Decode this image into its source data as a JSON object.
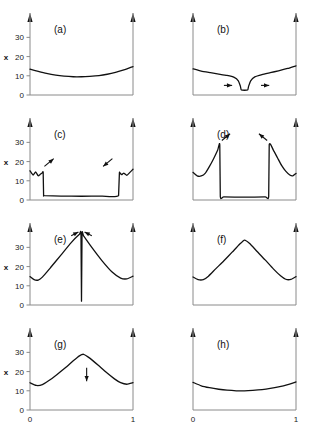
{
  "figure": {
    "title": "",
    "axis_label_y": "x",
    "x_tick_labels": [
      "0",
      "1"
    ],
    "y_tick_labels": [
      "0",
      "10",
      "20",
      "30"
    ],
    "y_tick_values": [
      0,
      10,
      20,
      30
    ],
    "x_tick_values": [
      0,
      1
    ],
    "panel_labels": [
      "(a)",
      "(b)",
      "(c)",
      "(d)",
      "(e)",
      "(f)",
      "(g)",
      "(h)"
    ],
    "colors": {
      "curve": "#111111",
      "axis": "#8a8a8a",
      "background": "#ffffff",
      "annotation": "#111111"
    }
  },
  "chart_data": {
    "type": "line",
    "title": "",
    "xlabel": "",
    "ylabel": "x",
    "xlim": [
      0,
      1
    ],
    "ylim": [
      0,
      38
    ],
    "grid": false,
    "legend": "none",
    "x_ticks": [
      0,
      1
    ],
    "x_ticklabels": [
      "0",
      "1"
    ],
    "y_ticks": [
      0,
      10,
      20,
      30
    ],
    "y_ticklabels": [
      "0",
      "10",
      "20",
      "30"
    ],
    "panels": [
      {
        "label": "(a)",
        "row": 0,
        "col": 0,
        "description": "shallow symmetric basin, weakly concave-up profile",
        "x": [
          0.0,
          0.08,
          0.16,
          0.25,
          0.33,
          0.42,
          0.5,
          0.58,
          0.67,
          0.75,
          0.83,
          0.92,
          1.0
        ],
        "y": [
          13.5,
          12.3,
          11.2,
          10.3,
          9.8,
          9.5,
          9.5,
          9.7,
          10.1,
          10.8,
          11.8,
          13.2,
          14.8
        ],
        "annotations": []
      },
      {
        "label": "(b)",
        "row": 0,
        "col": 1,
        "description": "broad basin with a narrow central notch down to baseline; horizontal arrows flanking the notch",
        "x": [
          0.0,
          0.08,
          0.17,
          0.25,
          0.33,
          0.4,
          0.44,
          0.46,
          0.47,
          0.53,
          0.54,
          0.56,
          0.6,
          0.67,
          0.75,
          0.83,
          0.92,
          1.0
        ],
        "y": [
          13.6,
          12.4,
          11.6,
          10.9,
          10.2,
          9.2,
          7.4,
          4.6,
          2.6,
          2.6,
          4.6,
          7.4,
          9.4,
          10.6,
          11.6,
          12.6,
          13.8,
          15.2
        ],
        "annotations": [
          {
            "type": "arrow",
            "x": 0.3,
            "y": 5.0,
            "dx": 0.08,
            "dy": 0.0,
            "direction": "right"
          },
          {
            "type": "arrow",
            "x": 0.66,
            "y": 5.0,
            "dx": 0.08,
            "dy": 0.0,
            "direction": "right"
          }
        ]
      },
      {
        "label": "(c)",
        "row": 1,
        "col": 0,
        "description": "wide flat depleted floor near baseline bounded by near-vertical walls with small humps outside; diagonal arrows at both walls",
        "x": [
          0.0,
          0.03,
          0.055,
          0.08,
          0.1,
          0.12,
          0.128,
          0.132,
          0.14,
          0.3,
          0.5,
          0.7,
          0.86,
          0.868,
          0.872,
          0.89,
          0.91,
          0.94,
          0.97,
          1.0
        ],
        "y": [
          15.2,
          13.0,
          14.6,
          12.6,
          13.4,
          14.2,
          14.3,
          2.6,
          2.3,
          2.0,
          1.95,
          2.0,
          2.3,
          14.0,
          14.2,
          13.2,
          14.0,
          12.8,
          14.4,
          16.0
        ],
        "annotations": [
          {
            "type": "arrow",
            "x": 0.14,
            "y": 17.5,
            "dx": 0.09,
            "dy": 4.0,
            "direction": "up-right"
          },
          {
            "type": "arrow",
            "x": 0.8,
            "y": 21.5,
            "dx": -0.09,
            "dy": -4.0,
            "direction": "down-left"
          }
        ]
      },
      {
        "label": "(d)",
        "row": 1,
        "col": 1,
        "description": "deep wide flat well at baseline bounded by tall sharp peaks reaching ~29; diagonal arrows above each peak",
        "x": [
          0.0,
          0.04,
          0.08,
          0.12,
          0.16,
          0.2,
          0.24,
          0.26,
          0.265,
          0.3,
          0.5,
          0.7,
          0.735,
          0.74,
          0.78,
          0.82,
          0.86,
          0.9,
          0.94,
          0.97,
          1.0
        ],
        "y": [
          14.4,
          12.6,
          12.5,
          14.0,
          17.5,
          21.5,
          26.0,
          28.8,
          1.8,
          1.6,
          1.5,
          1.6,
          1.8,
          28.8,
          26.0,
          22.0,
          18.0,
          15.0,
          13.0,
          12.6,
          13.8
        ],
        "annotations": [
          {
            "type": "arrow",
            "x": 0.28,
            "y": 31.0,
            "dx": 0.08,
            "dy": 3.5,
            "direction": "up-right"
          },
          {
            "type": "arrow",
            "x": 0.72,
            "y": 31.0,
            "dx": -0.08,
            "dy": 3.5,
            "direction": "up-left"
          }
        ]
      },
      {
        "label": "(e)",
        "row": 2,
        "col": 0,
        "description": "tall symmetric tent peaking near 37 with an extremely narrow slit cut down to baseline at the apex; two arrows converging on the apex",
        "x": [
          0.0,
          0.04,
          0.08,
          0.12,
          0.2,
          0.3,
          0.4,
          0.48,
          0.495,
          0.5,
          0.505,
          0.52,
          0.6,
          0.7,
          0.8,
          0.88,
          0.94,
          1.0
        ],
        "y": [
          14.8,
          13.2,
          13.0,
          14.5,
          19.5,
          26.0,
          32.5,
          36.8,
          37.0,
          2.0,
          37.0,
          36.0,
          30.0,
          23.0,
          17.0,
          14.0,
          13.6,
          15.0
        ],
        "annotations": [
          {
            "type": "arrow",
            "x": 0.4,
            "y": 36.0,
            "dx": 0.07,
            "dy": 2.0,
            "direction": "up-right"
          },
          {
            "type": "arrow",
            "x": 0.6,
            "y": 36.0,
            "dx": -0.07,
            "dy": 2.0,
            "direction": "up-left"
          }
        ]
      },
      {
        "label": "(f)",
        "row": 2,
        "col": 1,
        "description": "smooth symmetric tent peaking near 34, no annotations",
        "x": [
          0.0,
          0.05,
          0.1,
          0.15,
          0.22,
          0.3,
          0.38,
          0.45,
          0.5,
          0.55,
          0.62,
          0.7,
          0.78,
          0.85,
          0.9,
          0.95,
          1.0
        ],
        "y": [
          14.6,
          13.2,
          13.2,
          15.0,
          18.8,
          23.0,
          27.5,
          31.5,
          33.8,
          32.0,
          28.0,
          23.5,
          18.8,
          15.2,
          13.4,
          13.3,
          14.8
        ],
        "annotations": []
      },
      {
        "label": "(g)",
        "row": 3,
        "col": 0,
        "description": "rounded symmetric hill peaking near 29; single vertical downward arrow just right of the crest",
        "x": [
          0.0,
          0.06,
          0.12,
          0.18,
          0.26,
          0.34,
          0.42,
          0.48,
          0.52,
          0.58,
          0.66,
          0.74,
          0.82,
          0.88,
          0.94,
          1.0
        ],
        "y": [
          14.2,
          12.8,
          13.2,
          15.2,
          18.4,
          21.8,
          25.6,
          28.2,
          29.0,
          27.0,
          23.4,
          19.6,
          16.2,
          14.2,
          13.4,
          14.2
        ],
        "annotations": [
          {
            "type": "arrow",
            "x": 0.55,
            "y": 22.0,
            "dx": 0.0,
            "dy": -7.0,
            "direction": "down"
          }
        ]
      },
      {
        "label": "(h)",
        "row": 3,
        "col": 1,
        "description": "shallow smooth symmetric bowl, flatter than (a)",
        "x": [
          0.0,
          0.08,
          0.16,
          0.25,
          0.33,
          0.42,
          0.5,
          0.58,
          0.67,
          0.75,
          0.83,
          0.92,
          1.0
        ],
        "y": [
          14.4,
          12.6,
          11.6,
          10.8,
          10.3,
          10.0,
          10.0,
          10.2,
          10.6,
          11.2,
          12.0,
          13.2,
          14.6
        ],
        "annotations": []
      }
    ]
  }
}
